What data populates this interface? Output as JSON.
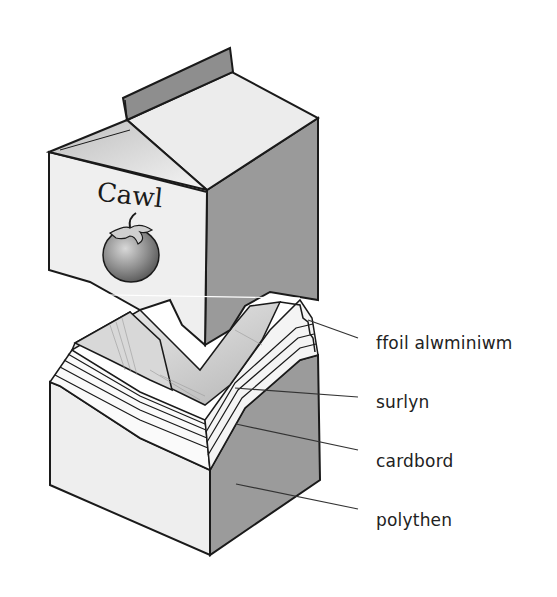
{
  "carton": {
    "brand_text": "Cawl",
    "brand_icon": "tomato-icon"
  },
  "labels": [
    {
      "id": "foil",
      "text": "ffoil alwminiwm"
    },
    {
      "id": "surlyn",
      "text": "surlyn"
    },
    {
      "id": "cardboard",
      "text": "cardbord"
    },
    {
      "id": "polythene",
      "text": "polythen"
    }
  ],
  "colors": {
    "background": "#ffffff",
    "front_face": "#eeeeee",
    "side_face": "#9a9a9a",
    "roof": "#e6e6e6",
    "outline": "#1a1a1a",
    "leader_line": "#333333"
  }
}
